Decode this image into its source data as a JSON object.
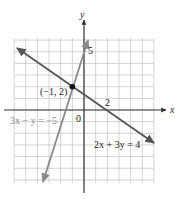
{
  "chart_data": {
    "type": "line",
    "title": "",
    "xlabel": "x",
    "ylabel": "y",
    "xlim": [
      -6,
      6
    ],
    "ylim": [
      -6,
      6
    ],
    "grid": true,
    "tick_labels": {
      "origin": "0",
      "x_marked": "2",
      "y_marked": "5"
    },
    "series": [
      {
        "name": "2x + 3y = 4",
        "equation": "2x + 3y = 4",
        "slope": -0.6667,
        "intercept": 1.3333,
        "x": [
          -5.8,
          6.0
        ],
        "y": [
          5.2,
          -2.67
        ],
        "color": "#555555"
      },
      {
        "name": "3x − y = −5",
        "equation": "3x - y = -5",
        "slope": 3,
        "intercept": 5,
        "x": [
          -3.5,
          0.35
        ],
        "y": [
          -5.5,
          6.0
        ],
        "color": "#8a8a8a"
      }
    ],
    "annotations": [
      {
        "text": "(−1, 2)",
        "x": -1,
        "y": 2,
        "type": "intersection-point"
      },
      {
        "text": "2",
        "x": 2,
        "y": 0,
        "type": "x-intercept"
      },
      {
        "text": "5",
        "x": 0,
        "y": 5,
        "type": "y-intercept"
      }
    ],
    "legend": "none (inline equation labels)"
  },
  "labels": {
    "axis_x": "x",
    "axis_y": "y",
    "origin": "0",
    "tick_x2": "2",
    "tick_y5": "5",
    "point": "(−1, 2)",
    "eq1": "2x + 3y = 4",
    "eq2": "3x − y = −5"
  },
  "colors": {
    "grid": "#c8c8c8",
    "axis": "#333333",
    "line1": "#555555",
    "line2": "#8a8a8a",
    "point": "#111111"
  }
}
